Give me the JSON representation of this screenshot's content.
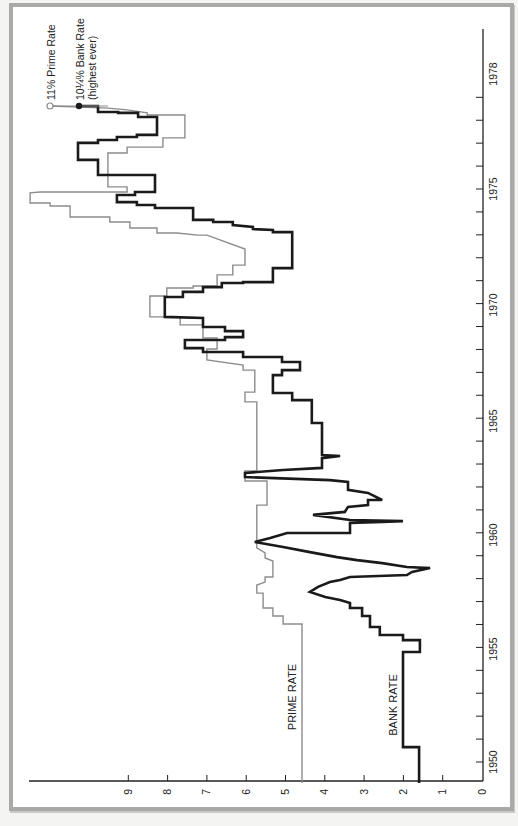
{
  "chart_data": {
    "type": "line",
    "step": true,
    "orientation": "rotated-90",
    "title": "",
    "xlabel": "",
    "ylabel": "",
    "x_axis": {
      "name": "year",
      "ticks": [
        1950,
        1955,
        1960,
        1965,
        1970,
        1975,
        1978
      ],
      "minor_tick_every": 1
    },
    "y_axis": {
      "name": "rate_percent",
      "ticks": [
        0,
        1,
        2,
        3,
        4,
        5,
        6,
        7,
        8,
        9
      ],
      "ylim": [
        0,
        11.6
      ]
    },
    "grid": false,
    "legend": "inline-labels",
    "series": [
      {
        "name": "PRIME RATE",
        "color": "#8c8c8c",
        "stroke_width": 1.4,
        "points": [
          [
            1949.08,
            4.58
          ],
          [
            1956.02,
            4.58
          ],
          [
            1956.02,
            5.06
          ],
          [
            1956.37,
            5.06
          ],
          [
            1956.37,
            5.32
          ],
          [
            1956.72,
            5.32
          ],
          [
            1956.72,
            5.57
          ],
          [
            1957.37,
            5.57
          ],
          [
            1957.37,
            5.73
          ],
          [
            1957.72,
            5.73
          ],
          [
            1957.85,
            5.52
          ],
          [
            1958.07,
            5.52
          ],
          [
            1958.07,
            5.32
          ],
          [
            1958.77,
            5.32
          ],
          [
            1958.9,
            5.52
          ],
          [
            1959.12,
            5.52
          ],
          [
            1959.34,
            5.73
          ],
          [
            1961.21,
            5.73
          ],
          [
            1961.21,
            5.47
          ],
          [
            1962.26,
            5.47
          ],
          [
            1962.26,
            6.03
          ],
          [
            1962.7,
            6.03
          ],
          [
            1962.7,
            5.73
          ],
          [
            1965.71,
            5.73
          ],
          [
            1965.71,
            6.03
          ],
          [
            1966.14,
            6.03
          ],
          [
            1966.14,
            5.78
          ],
          [
            1967.1,
            5.78
          ],
          [
            1967.1,
            6.08
          ],
          [
            1967.32,
            6.08
          ],
          [
            1967.54,
            7.0
          ],
          [
            1968.02,
            7.0
          ],
          [
            1968.02,
            6.74
          ],
          [
            1968.5,
            6.74
          ],
          [
            1968.5,
            7.1
          ],
          [
            1969.07,
            7.1
          ],
          [
            1969.07,
            7.68
          ],
          [
            1969.42,
            7.68
          ],
          [
            1969.42,
            8.45
          ],
          [
            1970.33,
            8.45
          ],
          [
            1970.33,
            8.02
          ],
          [
            1970.68,
            8.02
          ],
          [
            1970.68,
            7.35
          ],
          [
            1970.77,
            7.35
          ],
          [
            1970.77,
            6.74
          ],
          [
            1971.25,
            6.74
          ],
          [
            1971.25,
            6.34
          ],
          [
            1971.68,
            6.34
          ],
          [
            1971.68,
            6.03
          ],
          [
            1972.38,
            6.03
          ],
          [
            1972.99,
            7.0
          ],
          [
            1972.99,
            7.23
          ],
          [
            1973.08,
            7.76
          ],
          [
            1973.08,
            8.27
          ],
          [
            1973.3,
            8.27
          ],
          [
            1973.3,
            8.96
          ],
          [
            1973.56,
            8.96
          ],
          [
            1973.56,
            9.47
          ],
          [
            1973.78,
            9.47
          ],
          [
            1973.78,
            10.48
          ],
          [
            1974.26,
            10.48
          ],
          [
            1974.26,
            10.99
          ],
          [
            1974.39,
            10.99
          ],
          [
            1974.39,
            11.5
          ],
          [
            1974.83,
            11.5
          ],
          [
            1974.87,
            11.25
          ],
          [
            1974.87,
            9.03
          ],
          [
            1975.09,
            9.03
          ],
          [
            1975.09,
            9.52
          ],
          [
            1976.57,
            9.52
          ],
          [
            1976.57,
            9.03
          ],
          [
            1976.83,
            9.03
          ],
          [
            1976.83,
            8.12
          ],
          [
            1977.23,
            8.12
          ],
          [
            1977.23,
            7.56
          ],
          [
            1978.23,
            7.56
          ],
          [
            1978.23,
            8.52
          ],
          [
            1978.32,
            8.52
          ],
          [
            1978.45,
            9.03
          ],
          [
            1978.53,
            9.52
          ],
          [
            1978.62,
            10.99
          ]
        ],
        "end_marker": {
          "style": "open-circle",
          "label": "11% Prime Rate",
          "value": 11
        }
      },
      {
        "name": "BANK RATE",
        "color": "#1a1a1a",
        "stroke_width": 2.6,
        "points": [
          [
            1949.08,
            1.6
          ],
          [
            1950.65,
            1.6
          ],
          [
            1950.65,
            2.01
          ],
          [
            1954.8,
            2.01
          ],
          [
            1954.8,
            1.58
          ],
          [
            1955.32,
            1.58
          ],
          [
            1955.32,
            2.01
          ],
          [
            1955.54,
            2.01
          ],
          [
            1955.54,
            2.6
          ],
          [
            1955.89,
            2.6
          ],
          [
            1955.89,
            2.85
          ],
          [
            1956.37,
            2.85
          ],
          [
            1956.37,
            3.05
          ],
          [
            1956.72,
            3.05
          ],
          [
            1956.72,
            3.36
          ],
          [
            1956.94,
            3.36
          ],
          [
            1957.07,
            3.61
          ],
          [
            1957.2,
            3.99
          ],
          [
            1957.42,
            4.38
          ],
          [
            1957.64,
            4.17
          ],
          [
            1957.85,
            3.87
          ],
          [
            1957.94,
            3.61
          ],
          [
            1958.07,
            3.36
          ],
          [
            1958.16,
            1.91
          ],
          [
            1958.29,
            1.78
          ],
          [
            1958.46,
            1.32
          ],
          [
            1958.51,
            1.91
          ],
          [
            1958.68,
            2.54
          ],
          [
            1958.81,
            3.18
          ],
          [
            1958.94,
            3.69
          ],
          [
            1959.16,
            4.38
          ],
          [
            1959.38,
            5.06
          ],
          [
            1959.6,
            5.78
          ],
          [
            1959.77,
            5.39
          ],
          [
            1959.99,
            4.96
          ],
          [
            1959.99,
            3.36
          ],
          [
            1960.43,
            3.36
          ],
          [
            1960.47,
            2.54
          ],
          [
            1960.51,
            2.01
          ],
          [
            1960.56,
            3.36
          ],
          [
            1960.78,
            4.3
          ],
          [
            1960.91,
            3.49
          ],
          [
            1961.13,
            3.41
          ],
          [
            1961.21,
            2.9
          ],
          [
            1961.43,
            2.9
          ],
          [
            1961.43,
            2.54
          ],
          [
            1961.74,
            2.9
          ],
          [
            1961.87,
            3.41
          ],
          [
            1962.22,
            3.41
          ],
          [
            1962.3,
            3.87
          ],
          [
            1962.43,
            6.03
          ],
          [
            1962.61,
            6.03
          ],
          [
            1962.74,
            5.06
          ],
          [
            1962.83,
            4.07
          ],
          [
            1963.26,
            4.07
          ],
          [
            1963.35,
            3.61
          ],
          [
            1963.39,
            4.07
          ],
          [
            1964.79,
            4.07
          ],
          [
            1964.79,
            4.33
          ],
          [
            1965.79,
            4.33
          ],
          [
            1965.79,
            4.83
          ],
          [
            1966.1,
            4.83
          ],
          [
            1966.1,
            5.32
          ],
          [
            1966.88,
            5.32
          ],
          [
            1966.88,
            5.09
          ],
          [
            1967.1,
            5.09
          ],
          [
            1967.1,
            4.63
          ],
          [
            1967.45,
            4.63
          ],
          [
            1967.45,
            5.09
          ],
          [
            1967.67,
            5.09
          ],
          [
            1967.67,
            6.08
          ],
          [
            1967.89,
            6.08
          ],
          [
            1967.89,
            7.1
          ],
          [
            1968.06,
            7.1
          ],
          [
            1968.06,
            7.56
          ],
          [
            1968.41,
            7.56
          ],
          [
            1968.41,
            6.54
          ],
          [
            1968.54,
            6.54
          ],
          [
            1968.54,
            6.08
          ],
          [
            1968.8,
            6.08
          ],
          [
            1968.8,
            6.54
          ],
          [
            1968.98,
            6.54
          ],
          [
            1968.98,
            7.1
          ],
          [
            1969.37,
            7.1
          ],
          [
            1969.42,
            8.07
          ],
          [
            1970.29,
            8.07
          ],
          [
            1970.29,
            7.61
          ],
          [
            1970.51,
            7.61
          ],
          [
            1970.51,
            7.1
          ],
          [
            1970.72,
            7.1
          ],
          [
            1970.72,
            6.62
          ],
          [
            1970.9,
            6.62
          ],
          [
            1970.9,
            6.08
          ],
          [
            1970.94,
            6.08
          ],
          [
            1970.94,
            5.32
          ],
          [
            1971.55,
            5.32
          ],
          [
            1971.55,
            4.83
          ],
          [
            1973.12,
            4.83
          ],
          [
            1973.12,
            5.32
          ],
          [
            1973.21,
            5.32
          ],
          [
            1973.25,
            5.83
          ],
          [
            1973.34,
            5.83
          ],
          [
            1973.43,
            6.34
          ],
          [
            1973.56,
            6.34
          ],
          [
            1973.56,
            6.84
          ],
          [
            1973.65,
            6.84
          ],
          [
            1973.65,
            7.35
          ],
          [
            1974.17,
            7.35
          ],
          [
            1974.17,
            8.32
          ],
          [
            1974.3,
            8.32
          ],
          [
            1974.3,
            8.78
          ],
          [
            1974.43,
            8.78
          ],
          [
            1974.43,
            9.29
          ],
          [
            1974.74,
            9.29
          ],
          [
            1974.74,
            8.83
          ],
          [
            1974.87,
            8.83
          ],
          [
            1974.87,
            8.32
          ],
          [
            1975.61,
            8.32
          ],
          [
            1975.61,
            9.77
          ],
          [
            1976.27,
            9.77
          ],
          [
            1976.27,
            10.28
          ],
          [
            1977.01,
            10.28
          ],
          [
            1977.01,
            9.77
          ],
          [
            1977.14,
            9.77
          ],
          [
            1977.14,
            9.29
          ],
          [
            1977.27,
            9.29
          ],
          [
            1977.27,
            8.78
          ],
          [
            1977.36,
            8.78
          ],
          [
            1977.36,
            8.27
          ],
          [
            1978.14,
            8.27
          ],
          [
            1978.14,
            8.75
          ],
          [
            1978.32,
            8.75
          ],
          [
            1978.32,
            9.26
          ],
          [
            1978.36,
            9.26
          ],
          [
            1978.36,
            9.77
          ],
          [
            1978.62,
            9.77
          ],
          [
            1978.62,
            10.25
          ]
        ],
        "end_marker": {
          "style": "filled-circle",
          "label": "10¼% Bank Rate",
          "sublabel": "(highest ever)",
          "value": 10.25
        }
      }
    ]
  },
  "axes": {
    "rate_tick_labels": [
      "0",
      "1",
      "2",
      "3",
      "4",
      "5",
      "6",
      "7",
      "8",
      "9"
    ],
    "year_tick_labels": [
      "1950",
      "1955",
      "1960",
      "1965",
      "1970",
      "1975",
      "1978"
    ]
  },
  "labels": {
    "prime_rate": "PRIME RATE",
    "bank_rate": "BANK RATE",
    "prime_annotation": "11% Prime Rate",
    "bank_annotation": "10¼% Bank Rate",
    "bank_annotation_sub": "(highest ever)"
  },
  "colors": {
    "frame": "#a9a9a7",
    "axis": "#222222",
    "prime": "#8c8c8c",
    "bank": "#1a1a1a"
  }
}
